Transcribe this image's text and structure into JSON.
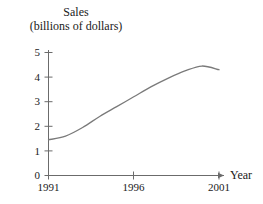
{
  "figure": {
    "width": 263,
    "height": 204,
    "background": "#ffffff",
    "axis_color": "#6b6b6b",
    "text_color": "#1a1a1a"
  },
  "title": {
    "line1": "Sales",
    "line2": "(billions of dollars)"
  },
  "chart_data": {
    "type": "line",
    "title": "Sales (billions of dollars)",
    "xlabel": "Year",
    "ylabel": "Sales (billions of dollars)",
    "xlim": [
      1991,
      2001
    ],
    "ylim": [
      0,
      5
    ],
    "grid": false,
    "legend": false,
    "line_color": "#7a7a7a",
    "x_tick_labels": [
      "1991",
      "1996",
      "2001"
    ],
    "x_tick_values": [
      1991,
      1996,
      2001
    ],
    "y_tick_labels": [
      "0",
      "1",
      "2",
      "3",
      "4",
      "5"
    ],
    "y_tick_values": [
      0,
      1,
      2,
      3,
      4,
      5
    ],
    "x": [
      1991,
      1992,
      1993,
      1994,
      1995,
      1996,
      1997,
      1998,
      1999,
      2000,
      2001
    ],
    "values": [
      1.45,
      1.6,
      1.95,
      2.4,
      2.8,
      3.2,
      3.6,
      3.95,
      4.25,
      4.45,
      4.3
    ],
    "series": [
      {
        "name": "Sales",
        "values": [
          1.45,
          1.6,
          1.95,
          2.4,
          2.8,
          3.2,
          3.6,
          3.95,
          4.25,
          4.45,
          4.3
        ]
      }
    ],
    "annotations": []
  },
  "axis_labels": {
    "x_axis_name": "Year",
    "y0": "0",
    "y1": "1",
    "y2": "2",
    "y3": "3",
    "y4": "4",
    "y5": "5",
    "x1991": "1991",
    "x1996": "1996",
    "x2001": "2001"
  }
}
